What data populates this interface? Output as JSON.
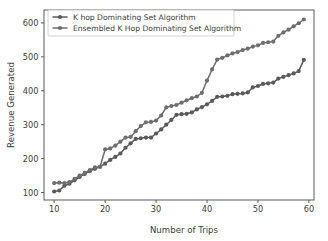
{
  "chart_data": {
    "type": "line",
    "title": "",
    "xlabel": "Number of Trips",
    "ylabel": "Revenue Generated",
    "xlim": [
      8,
      61
    ],
    "ylim": [
      78,
      638
    ],
    "xticks": [
      10,
      20,
      30,
      40,
      50,
      60
    ],
    "yticks": [
      100,
      200,
      300,
      400,
      500,
      600
    ],
    "grid": false,
    "legend_position": "upper left",
    "marker": "circle",
    "series": [
      {
        "name": "K hop Dominating Set Algorithm",
        "color": "#5a5a5a",
        "x": [
          10,
          11,
          12,
          13,
          14,
          15,
          16,
          17,
          18,
          19,
          20,
          21,
          22,
          23,
          24,
          25,
          26,
          27,
          28,
          29,
          30,
          31,
          32,
          33,
          34,
          35,
          36,
          37,
          38,
          39,
          40,
          41,
          42,
          43,
          44,
          45,
          46,
          47,
          48,
          49,
          50,
          51,
          52,
          53,
          54,
          55,
          56,
          57,
          58,
          59
        ],
        "values": [
          103,
          106,
          120,
          126,
          136,
          146,
          155,
          163,
          170,
          176,
          185,
          196,
          205,
          215,
          232,
          245,
          258,
          260,
          262,
          262,
          274,
          286,
          300,
          314,
          329,
          331,
          332,
          336,
          345,
          352,
          360,
          370,
          382,
          383,
          385,
          390,
          391,
          392,
          395,
          410,
          414,
          420,
          422,
          424,
          436,
          441,
          446,
          451,
          458,
          491
        ]
      },
      {
        "name": "Ensembled K Hop Dominating Set Algorithm",
        "color": "#6e6e6e",
        "x": [
          10,
          11,
          12,
          13,
          14,
          15,
          16,
          17,
          18,
          19,
          20,
          21,
          22,
          23,
          24,
          25,
          26,
          27,
          28,
          29,
          30,
          31,
          32,
          33,
          34,
          35,
          36,
          37,
          38,
          39,
          40,
          41,
          42,
          43,
          44,
          45,
          46,
          47,
          48,
          49,
          50,
          51,
          52,
          53,
          54,
          55,
          56,
          57,
          58,
          59
        ],
        "values": [
          128,
          129,
          128,
          131,
          140,
          150,
          158,
          166,
          174,
          176,
          227,
          230,
          238,
          250,
          262,
          264,
          281,
          296,
          307,
          308,
          312,
          327,
          351,
          355,
          358,
          365,
          372,
          378,
          383,
          394,
          430,
          463,
          492,
          497,
          504,
          510,
          514,
          520,
          524,
          530,
          534,
          541,
          543,
          545,
          562,
          572,
          580,
          590,
          599,
          610
        ]
      }
    ]
  }
}
